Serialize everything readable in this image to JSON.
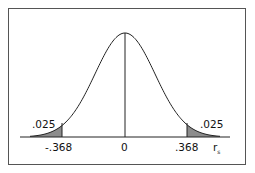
{
  "chart_data": {
    "type": "area",
    "title": "",
    "xlabel": "r_s",
    "ylabel": "",
    "x_ticks": [
      "-.368",
      "0",
      ".368"
    ],
    "critical_values": [
      -0.368,
      0.368
    ],
    "tail_areas": [
      {
        "side": "left",
        "label": ".025",
        "value": 0.025
      },
      {
        "side": "right",
        "label": ".025",
        "value": 0.025
      }
    ],
    "center": 0,
    "grid": false,
    "legend": null
  },
  "labels": {
    "left_tail": ".025",
    "right_tail": ".025",
    "tick_left": "-.368",
    "tick_center": "0",
    "tick_right": ".368",
    "axis_var": "r",
    "axis_sub": "s"
  },
  "colors": {
    "shade": "#8c8c8c",
    "line": "#222222",
    "frame": "#555555"
  }
}
